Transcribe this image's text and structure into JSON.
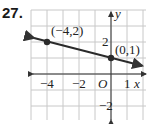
{
  "problem_number": "27.",
  "chart_data": {
    "type": "line",
    "title": "",
    "xlabel": "x",
    "ylabel": "y",
    "xlim": [
      -5,
      2
    ],
    "ylim": [
      -3,
      4
    ],
    "grid": true,
    "x_ticks": [
      {
        "value": -4,
        "label": "−4"
      },
      {
        "value": -2,
        "label": "−2"
      },
      {
        "value": 1,
        "label": "1"
      }
    ],
    "y_ticks": [
      {
        "value": 2,
        "label": "2"
      },
      {
        "value": -2,
        "label": "−2"
      }
    ],
    "origin_label": "O",
    "series": [
      {
        "name": "line",
        "x": [
          -4,
          0
        ],
        "y": [
          2,
          1
        ],
        "equation_slope": -0.25,
        "equation_intercept": 1
      }
    ],
    "points": [
      {
        "x": -4,
        "y": 2,
        "label": "(−4,2)"
      },
      {
        "x": 0,
        "y": 1,
        "label": "(0,1)"
      }
    ],
    "colors": {
      "grid": "#c8c8c8",
      "axis": "#333333",
      "line": "#2a2a2a"
    }
  }
}
